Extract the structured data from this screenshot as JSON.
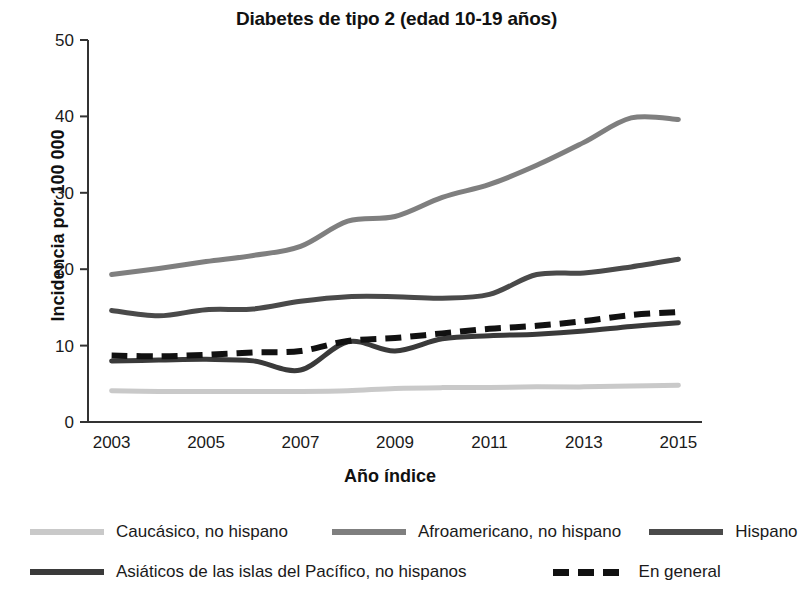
{
  "chart_data": {
    "type": "line",
    "title": "Diabetes de tipo 2 (edad 10-19 años)",
    "xlabel": "Año índice",
    "ylabel": "Incidencia por 100 000",
    "xlim": [
      2002.5,
      2015.5
    ],
    "ylim": [
      0,
      50
    ],
    "yticks": [
      0,
      10,
      20,
      30,
      40,
      50
    ],
    "xticks": [
      2003,
      2005,
      2007,
      2009,
      2011,
      2013,
      2015
    ],
    "xtick_labels": [
      "2003",
      "2005",
      "2007",
      "2009",
      "2011",
      "2013",
      "2015"
    ],
    "ytick_labels": [
      "0",
      "10",
      "20",
      "30",
      "40",
      "50"
    ],
    "grid": false,
    "legend_position": "below",
    "x": [
      2003,
      2004,
      2005,
      2006,
      2007,
      2008,
      2009,
      2010,
      2011,
      2012,
      2013,
      2014,
      2015
    ],
    "series": [
      {
        "name": "Caucásico, no hispano",
        "color": "#c9c9c9",
        "style": "solid",
        "values": [
          4.1,
          4.0,
          4.0,
          4.0,
          4.0,
          4.1,
          4.4,
          4.5,
          4.5,
          4.6,
          4.6,
          4.7,
          4.8
        ]
      },
      {
        "name": "Afroamericano, no hispano",
        "color": "#7f7f7f",
        "style": "solid",
        "values": [
          19.3,
          20.1,
          21.0,
          21.8,
          23.0,
          26.3,
          26.9,
          29.4,
          31.1,
          33.6,
          36.6,
          39.8,
          39.6
        ]
      },
      {
        "name": "Hispano",
        "color": "#4a4a4a",
        "style": "solid",
        "values": [
          14.6,
          13.9,
          14.7,
          14.8,
          15.8,
          16.4,
          16.4,
          16.2,
          16.7,
          19.3,
          19.5,
          20.3,
          21.3
        ]
      },
      {
        "name": "Asiáticos de las islas del Pacífico, no hispanos",
        "color": "#3a3a3a",
        "style": "solid",
        "values": [
          8.0,
          8.1,
          8.2,
          8.0,
          6.8,
          10.5,
          9.3,
          10.9,
          11.3,
          11.5,
          11.9,
          12.5,
          13.0
        ]
      },
      {
        "name": "En general",
        "color": "#111111",
        "style": "dashed",
        "values": [
          8.7,
          8.6,
          8.8,
          9.1,
          9.3,
          10.6,
          11.0,
          11.6,
          12.2,
          12.6,
          13.2,
          14.0,
          14.4
        ]
      }
    ],
    "legend": [
      {
        "label": "Caucásico, no hispano",
        "color": "#c9c9c9",
        "style": "solid"
      },
      {
        "label": "Afroamericano, no hispano",
        "color": "#7f7f7f",
        "style": "solid"
      },
      {
        "label": "Hispano",
        "color": "#4a4a4a",
        "style": "solid"
      },
      {
        "label": "Asiáticos de las islas del Pacífico, no hispanos",
        "color": "#3a3a3a",
        "style": "solid"
      },
      {
        "label": "En general",
        "color": "#111111",
        "style": "dashed"
      }
    ]
  }
}
